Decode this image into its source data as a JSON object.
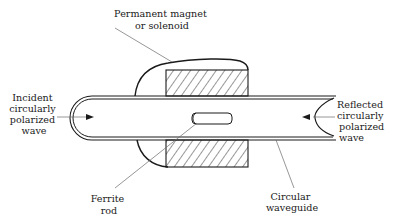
{
  "diagram": {
    "labels": {
      "magnet": [
        "Permanent magnet",
        "or solenoid"
      ],
      "incident": [
        "Incident",
        "circularly",
        "polarized",
        "wave"
      ],
      "reflected": [
        "Reflected",
        "circularly",
        "polarized",
        "wave"
      ],
      "ferrite": [
        "Ferrite",
        "rod"
      ],
      "waveguide": [
        "Circular",
        "waveguide"
      ]
    },
    "colors": {
      "ink": "#1a1a1a",
      "leader": "#6a6a6a",
      "background": "#ffffff"
    }
  }
}
